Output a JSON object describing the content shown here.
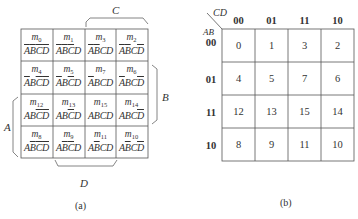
{
  "map_a": {
    "caption": "(a)",
    "label_C": "C",
    "label_B": "B",
    "label_A": "A",
    "label_D": "D",
    "cells": [
      [
        {
          "m": "m",
          "i": "0",
          "lits": [
            [
              "A",
              1
            ],
            [
              "B",
              1
            ],
            [
              "C",
              1
            ],
            [
              "D",
              1
            ]
          ]
        },
        {
          "m": "m",
          "i": "1",
          "lits": [
            [
              "A",
              1
            ],
            [
              "B",
              1
            ],
            [
              "C",
              1
            ],
            [
              "D",
              0
            ]
          ]
        },
        {
          "m": "m",
          "i": "3",
          "lits": [
            [
              "A",
              1
            ],
            [
              "B",
              1
            ],
            [
              "C",
              0
            ],
            [
              "D",
              0
            ]
          ]
        },
        {
          "m": "m",
          "i": "2",
          "lits": [
            [
              "A",
              1
            ],
            [
              "B",
              1
            ],
            [
              "C",
              0
            ],
            [
              "D",
              1
            ]
          ]
        }
      ],
      [
        {
          "m": "m",
          "i": "4",
          "lits": [
            [
              "A",
              1
            ],
            [
              "B",
              0
            ],
            [
              "C",
              1
            ],
            [
              "D",
              1
            ]
          ]
        },
        {
          "m": "m",
          "i": "5",
          "lits": [
            [
              "A",
              1
            ],
            [
              "B",
              0
            ],
            [
              "C",
              1
            ],
            [
              "D",
              0
            ]
          ]
        },
        {
          "m": "m",
          "i": "7",
          "lits": [
            [
              "A",
              1
            ],
            [
              "B",
              0
            ],
            [
              "C",
              0
            ],
            [
              "D",
              0
            ]
          ]
        },
        {
          "m": "m",
          "i": "6",
          "lits": [
            [
              "A",
              1
            ],
            [
              "B",
              0
            ],
            [
              "C",
              0
            ],
            [
              "D",
              1
            ]
          ]
        }
      ],
      [
        {
          "m": "m",
          "i": "12",
          "lits": [
            [
              "A",
              0
            ],
            [
              "B",
              0
            ],
            [
              "C",
              1
            ],
            [
              "D",
              1
            ]
          ]
        },
        {
          "m": "m",
          "i": "13",
          "lits": [
            [
              "A",
              0
            ],
            [
              "B",
              0
            ],
            [
              "C",
              1
            ],
            [
              "D",
              0
            ]
          ]
        },
        {
          "m": "m",
          "i": "15",
          "lits": [
            [
              "A",
              0
            ],
            [
              "B",
              0
            ],
            [
              "C",
              0
            ],
            [
              "D",
              0
            ]
          ]
        },
        {
          "m": "m",
          "i": "14",
          "lits": [
            [
              "A",
              0
            ],
            [
              "B",
              0
            ],
            [
              "C",
              0
            ],
            [
              "D",
              1
            ]
          ]
        }
      ],
      [
        {
          "m": "m",
          "i": "8",
          "lits": [
            [
              "A",
              0
            ],
            [
              "B",
              1
            ],
            [
              "C",
              1
            ],
            [
              "D",
              1
            ]
          ]
        },
        {
          "m": "m",
          "i": "9",
          "lits": [
            [
              "A",
              0
            ],
            [
              "B",
              1
            ],
            [
              "C",
              1
            ],
            [
              "D",
              0
            ]
          ]
        },
        {
          "m": "m",
          "i": "11",
          "lits": [
            [
              "A",
              0
            ],
            [
              "B",
              1
            ],
            [
              "C",
              0
            ],
            [
              "D",
              0
            ]
          ]
        },
        {
          "m": "m",
          "i": "10",
          "lits": [
            [
              "A",
              0
            ],
            [
              "B",
              1
            ],
            [
              "C",
              0
            ],
            [
              "D",
              1
            ]
          ]
        }
      ]
    ]
  },
  "map_b": {
    "caption": "(b)",
    "corner_col_var": "CD",
    "corner_row_var": "AB",
    "col_headers": [
      "00",
      "01",
      "11",
      "10"
    ],
    "row_headers": [
      "00",
      "01",
      "11",
      "10"
    ],
    "cells": [
      [
        "0",
        "1",
        "3",
        "2"
      ],
      [
        "4",
        "5",
        "7",
        "6"
      ],
      [
        "12",
        "13",
        "15",
        "14"
      ],
      [
        "8",
        "9",
        "11",
        "10"
      ]
    ]
  }
}
